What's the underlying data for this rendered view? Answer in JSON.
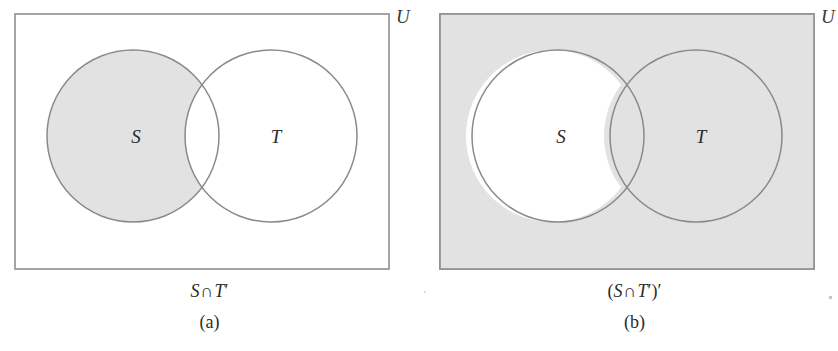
{
  "figure": {
    "type": "venn-diagram-pair",
    "colors": {
      "shade": "#e2e2e2",
      "stroke": "#8a8a8a",
      "rect_stroke": "#8f8f8f",
      "text": "#2b2b2b",
      "background": "#ffffff"
    }
  },
  "panels": [
    {
      "id": "a",
      "universe_label": "U",
      "set_labels": {
        "left": "S",
        "right": "T"
      },
      "caption_expression": "S ∩ T′",
      "caption_parts": {
        "open_paren": "",
        "left_set": "S",
        "operator": "∩",
        "right_set": "T",
        "right_prime": "′",
        "close_paren": "",
        "outer_prime": ""
      },
      "caption_index": "(a)",
      "shaded_region": "S-minus-T",
      "rect_filled": false
    },
    {
      "id": "b",
      "universe_label": "U",
      "set_labels": {
        "left": "S",
        "right": "T"
      },
      "caption_expression": "(S ∩ T′)′",
      "caption_parts": {
        "open_paren": "(",
        "left_set": "S",
        "operator": "∩",
        "right_set": "T",
        "right_prime": "′",
        "close_paren": ")",
        "outer_prime": "′"
      },
      "caption_index": "(b)",
      "shaded_region": "complement-of-S-minus-T",
      "rect_filled": true
    }
  ],
  "geometry": {
    "rect": {
      "x": 15,
      "y": 14,
      "width": 374,
      "height": 255
    },
    "circle_s": {
      "cx": 133,
      "cy": 136,
      "r": 86
    },
    "circle_t": {
      "cx": 271,
      "cy": 136,
      "r": 86
    },
    "label_s": {
      "x": 136,
      "y": 143
    },
    "label_t": {
      "x": 276,
      "y": 143
    }
  }
}
